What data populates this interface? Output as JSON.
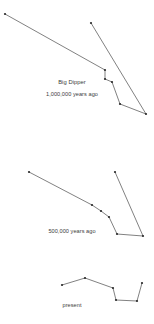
{
  "figure": {
    "name": "big-dipper-proper-motion",
    "background_color": "#ffffff",
    "line_color": "#4a4a4a",
    "star_color": "#2a2a2a",
    "text_color": "#3c3c3c",
    "width": 154,
    "height": 324
  },
  "panels": [
    {
      "id": "panel-1000000-years-ago",
      "title": "Big Dipper",
      "caption": "1,000,000 years ago",
      "title_x": 72,
      "title_y": 84,
      "caption_x": 72,
      "caption_y": 96,
      "stars": [
        {
          "name": "star-1",
          "x": 5,
          "y": 14
        },
        {
          "name": "star-2",
          "x": 105,
          "y": 70
        },
        {
          "name": "star-3",
          "x": 105,
          "y": 79
        },
        {
          "name": "star-4",
          "x": 112,
          "y": 82
        },
        {
          "name": "star-5",
          "x": 120,
          "y": 104
        },
        {
          "name": "star-6",
          "x": 146,
          "y": 114
        },
        {
          "name": "star-7",
          "x": 91,
          "y": 23
        }
      ],
      "polyline": "5,14 105,70 105,79 112,82 120,104 146,114 91,23"
    },
    {
      "id": "panel-500000-years-ago",
      "title": "",
      "caption": "500,000 years ago",
      "caption_x": 72,
      "caption_y": 233,
      "stars": [
        {
          "name": "star-1",
          "x": 29,
          "y": 172
        },
        {
          "name": "star-2",
          "x": 92,
          "y": 205
        },
        {
          "name": "star-3",
          "x": 101,
          "y": 211
        },
        {
          "name": "star-4",
          "x": 109,
          "y": 217
        },
        {
          "name": "star-5",
          "x": 117,
          "y": 234
        },
        {
          "name": "star-6",
          "x": 143,
          "y": 236
        },
        {
          "name": "star-7",
          "x": 115,
          "y": 172
        }
      ],
      "polyline": "29,172 92,205 101,211 109,217 117,234 143,236 115,172"
    },
    {
      "id": "panel-present",
      "title": "",
      "caption": "present",
      "caption_x": 72,
      "caption_y": 307,
      "stars": [
        {
          "name": "star-1",
          "x": 62,
          "y": 285
        },
        {
          "name": "star-2",
          "x": 85,
          "y": 278
        },
        {
          "name": "star-3",
          "x": 113,
          "y": 288
        },
        {
          "name": "star-4",
          "x": 116,
          "y": 300
        },
        {
          "name": "star-5",
          "x": 137,
          "y": 301
        },
        {
          "name": "star-6",
          "x": 142,
          "y": 283
        }
      ],
      "polyline": "62,285 85,278 113,288 116,300 137,301 142,283"
    }
  ]
}
